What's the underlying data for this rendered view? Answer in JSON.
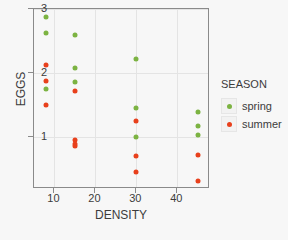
{
  "chart_data": {
    "type": "scatter",
    "title": "",
    "xlabel": "DENSITY",
    "ylabel": "EGGS",
    "xlim": [
      5,
      48
    ],
    "ylim": [
      0.18,
      3.0
    ],
    "xticks": [
      10,
      20,
      30,
      40
    ],
    "yticks": [
      1,
      2,
      3
    ],
    "grid": true,
    "legend_title": "SEASON",
    "legend_position": "right",
    "colors": {
      "spring": "#7cb342",
      "summer": "#e8401c",
      "background": "#f7f7f7",
      "axis": "#8a8a8a",
      "grid": "#e4e4e4",
      "text": "#3c3c3c"
    },
    "series": [
      {
        "name": "spring",
        "color": "#7cb342",
        "points": [
          {
            "x": 8,
            "y": 2.87
          },
          {
            "x": 8,
            "y": 2.62
          },
          {
            "x": 8,
            "y": 1.74
          },
          {
            "x": 15,
            "y": 2.59
          },
          {
            "x": 15,
            "y": 2.07
          },
          {
            "x": 15,
            "y": 1.86
          },
          {
            "x": 30,
            "y": 2.22
          },
          {
            "x": 30,
            "y": 1.45
          },
          {
            "x": 30,
            "y": 1.0
          },
          {
            "x": 45,
            "y": 1.38
          },
          {
            "x": 45,
            "y": 1.16
          },
          {
            "x": 45,
            "y": 1.02
          }
        ]
      },
      {
        "name": "summer",
        "color": "#e8401c",
        "points": [
          {
            "x": 8,
            "y": 2.12
          },
          {
            "x": 8,
            "y": 1.87
          },
          {
            "x": 8,
            "y": 1.49
          },
          {
            "x": 15,
            "y": 1.72
          },
          {
            "x": 15,
            "y": 0.94
          },
          {
            "x": 15,
            "y": 0.89
          },
          {
            "x": 15,
            "y": 0.85
          },
          {
            "x": 30,
            "y": 1.25
          },
          {
            "x": 30,
            "y": 0.69
          },
          {
            "x": 30,
            "y": 0.44
          },
          {
            "x": 45,
            "y": 0.71
          },
          {
            "x": 45,
            "y": 0.3
          }
        ]
      }
    ]
  }
}
